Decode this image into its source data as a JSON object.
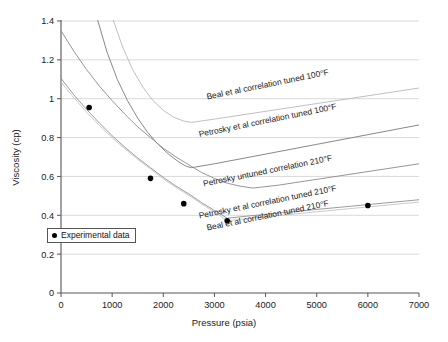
{
  "chart_data": {
    "type": "line",
    "title": "",
    "xlabel": "Pressure (psia)",
    "ylabel": "Viscosity (cp)",
    "xlim": [
      0,
      7000
    ],
    "ylim": [
      0,
      1.4
    ],
    "xticks": [
      0,
      1000,
      2000,
      3000,
      4000,
      5000,
      6000,
      7000
    ],
    "yticks": [
      0,
      0.2,
      0.4,
      0.6,
      0.8,
      1,
      1.2,
      1.4
    ],
    "xtick_labels": [
      "0",
      "1000",
      "2000",
      "3000",
      "4000",
      "5000",
      "6000",
      "7000"
    ],
    "ytick_labels": [
      "0",
      "0.2",
      "0.4",
      "0.6",
      "0.8",
      "1",
      "1.2",
      "1.4"
    ],
    "grid": "horizontal",
    "legend": {
      "position": "inner-left",
      "entries": [
        {
          "label": "Experimental data",
          "marker": "filled-circle",
          "color": "#000000"
        }
      ]
    },
    "series": [
      {
        "name": "Beal et al correlation tuned 100°F",
        "label": "Beal et al correlation tuned 100°F",
        "color": "#b8b8b8",
        "label_anchor": {
          "x": 4050,
          "y": 1.06
        },
        "points": [
          {
            "x": 1000,
            "y": 1.42
          },
          {
            "x": 1200,
            "y": 1.27
          },
          {
            "x": 1400,
            "y": 1.15
          },
          {
            "x": 1600,
            "y": 1.06
          },
          {
            "x": 1800,
            "y": 0.99
          },
          {
            "x": 2000,
            "y": 0.94
          },
          {
            "x": 2200,
            "y": 0.905
          },
          {
            "x": 2400,
            "y": 0.885
          },
          {
            "x": 2550,
            "y": 0.878
          },
          {
            "x": 3000,
            "y": 0.895
          },
          {
            "x": 4000,
            "y": 0.935
          },
          {
            "x": 5000,
            "y": 0.975
          },
          {
            "x": 6000,
            "y": 1.015
          },
          {
            "x": 7000,
            "y": 1.055
          }
        ]
      },
      {
        "name": "Petrosky et al correlation tuned 100°F",
        "label": "Petrosky et al correlation tuned 100°F",
        "color": "#7a7a7a",
        "label_anchor": {
          "x": 4050,
          "y": 0.875
        },
        "points": [
          {
            "x": 700,
            "y": 1.42
          },
          {
            "x": 900,
            "y": 1.24
          },
          {
            "x": 1100,
            "y": 1.1
          },
          {
            "x": 1300,
            "y": 0.99
          },
          {
            "x": 1500,
            "y": 0.9
          },
          {
            "x": 1700,
            "y": 0.825
          },
          {
            "x": 1900,
            "y": 0.765
          },
          {
            "x": 2100,
            "y": 0.715
          },
          {
            "x": 2300,
            "y": 0.675
          },
          {
            "x": 2450,
            "y": 0.652
          },
          {
            "x": 2550,
            "y": 0.645
          },
          {
            "x": 3000,
            "y": 0.665
          },
          {
            "x": 4000,
            "y": 0.715
          },
          {
            "x": 5000,
            "y": 0.765
          },
          {
            "x": 6000,
            "y": 0.815
          },
          {
            "x": 7000,
            "y": 0.865
          }
        ]
      },
      {
        "name": "Petrosky untuned correlation 210°F",
        "label": "Petrosky untuned correlation 210°F",
        "color": "#8a8a8a",
        "label_anchor": {
          "x": 4050,
          "y": 0.615
        },
        "points": [
          {
            "x": 0,
            "y": 1.35
          },
          {
            "x": 250,
            "y": 1.245
          },
          {
            "x": 500,
            "y": 1.15
          },
          {
            "x": 750,
            "y": 1.065
          },
          {
            "x": 1000,
            "y": 0.99
          },
          {
            "x": 1250,
            "y": 0.92
          },
          {
            "x": 1500,
            "y": 0.855
          },
          {
            "x": 1750,
            "y": 0.8
          },
          {
            "x": 2000,
            "y": 0.745
          },
          {
            "x": 2250,
            "y": 0.7
          },
          {
            "x": 2500,
            "y": 0.66
          },
          {
            "x": 2750,
            "y": 0.62
          },
          {
            "x": 3000,
            "y": 0.59
          },
          {
            "x": 3250,
            "y": 0.565
          },
          {
            "x": 3500,
            "y": 0.55
          },
          {
            "x": 3750,
            "y": 0.54
          },
          {
            "x": 4250,
            "y": 0.555
          },
          {
            "x": 5000,
            "y": 0.585
          },
          {
            "x": 6000,
            "y": 0.625
          },
          {
            "x": 7000,
            "y": 0.665
          }
        ]
      },
      {
        "name": "Petrosky et al correlation tuned 210°F",
        "label": "Petrosky et al correlation tuned 210°F",
        "color": "#909090",
        "label_anchor": {
          "x": 4050,
          "y": 0.455
        },
        "points": [
          {
            "x": 0,
            "y": 1.105
          },
          {
            "x": 250,
            "y": 1.02
          },
          {
            "x": 500,
            "y": 0.945
          },
          {
            "x": 750,
            "y": 0.875
          },
          {
            "x": 1000,
            "y": 0.81
          },
          {
            "x": 1250,
            "y": 0.75
          },
          {
            "x": 1500,
            "y": 0.695
          },
          {
            "x": 1750,
            "y": 0.645
          },
          {
            "x": 2000,
            "y": 0.595
          },
          {
            "x": 2250,
            "y": 0.55
          },
          {
            "x": 2500,
            "y": 0.51
          },
          {
            "x": 2750,
            "y": 0.465
          },
          {
            "x": 3000,
            "y": 0.425
          },
          {
            "x": 3250,
            "y": 0.385
          },
          {
            "x": 4000,
            "y": 0.405
          },
          {
            "x": 5000,
            "y": 0.43
          },
          {
            "x": 6000,
            "y": 0.455
          },
          {
            "x": 7000,
            "y": 0.48
          }
        ]
      },
      {
        "name": "Beal et al correlation tuned 210°F",
        "label": "Beal et al correlation tuned 210°F",
        "color": "#c4c4c4",
        "label_anchor": {
          "x": 4050,
          "y": 0.385
        },
        "points": [
          {
            "x": 0,
            "y": 1.085
          },
          {
            "x": 250,
            "y": 1.005
          },
          {
            "x": 500,
            "y": 0.93
          },
          {
            "x": 750,
            "y": 0.862
          },
          {
            "x": 1000,
            "y": 0.8
          },
          {
            "x": 1250,
            "y": 0.742
          },
          {
            "x": 1500,
            "y": 0.688
          },
          {
            "x": 1750,
            "y": 0.638
          },
          {
            "x": 2000,
            "y": 0.588
          },
          {
            "x": 2250,
            "y": 0.543
          },
          {
            "x": 2500,
            "y": 0.503
          },
          {
            "x": 2750,
            "y": 0.458
          },
          {
            "x": 3000,
            "y": 0.418
          },
          {
            "x": 3250,
            "y": 0.372
          },
          {
            "x": 4000,
            "y": 0.392
          },
          {
            "x": 5000,
            "y": 0.418
          },
          {
            "x": 6000,
            "y": 0.443
          },
          {
            "x": 7000,
            "y": 0.468
          }
        ]
      }
    ],
    "experimental_data": {
      "name": "Experimental data",
      "marker": "filled-circle",
      "color": "#000000",
      "points": [
        {
          "x": 550,
          "y": 0.955
        },
        {
          "x": 1750,
          "y": 0.59
        },
        {
          "x": 2400,
          "y": 0.46
        },
        {
          "x": 3250,
          "y": 0.372
        },
        {
          "x": 6000,
          "y": 0.45
        }
      ]
    }
  },
  "axes": {
    "x_title": "Pressure (psia)",
    "y_title": "Viscosity (cp)"
  },
  "legend_box": {
    "label": "Experimental data"
  }
}
